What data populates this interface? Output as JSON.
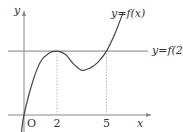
{
  "chart_data": {
    "type": "line",
    "title": "",
    "xlabel": "x",
    "ylabel": "y",
    "origin_label": "O",
    "x_ticks": [
      2,
      5
    ],
    "x_tick_labels": [
      "2",
      "5"
    ],
    "xlim": [
      -0.3,
      7.0
    ],
    "ylim": [
      -0.9,
      4.9
    ],
    "grid": false,
    "series": [
      {
        "name": "y=f(x)",
        "kind": "cubic",
        "description": "f(0)=0, local max at x=2, local min between 2 and 5, f(5)=f(2)",
        "points": [
          [
            -0.15,
            -0.8
          ],
          [
            0,
            0
          ],
          [
            0.5,
            1.5
          ],
          [
            1,
            2.5
          ],
          [
            1.5,
            2.9
          ],
          [
            2,
            3
          ],
          [
            2.5,
            2.85
          ],
          [
            3,
            2.4
          ],
          [
            3.5,
            2.1
          ],
          [
            4,
            2.2
          ],
          [
            4.5,
            2.5
          ],
          [
            5,
            3
          ],
          [
            5.5,
            3.8
          ],
          [
            6,
            4.8
          ]
        ]
      }
    ],
    "reference_lines": [
      {
        "name": "y=f(2)",
        "orientation": "horizontal",
        "value": 3
      }
    ],
    "guides": [
      {
        "x": 2,
        "from": 0,
        "to": 3,
        "style": "dotted"
      },
      {
        "x": 5,
        "from": 0,
        "to": 3,
        "style": "dotted"
      }
    ],
    "annotations": [
      {
        "text": "y=f(x)",
        "position": "near curve top-right"
      },
      {
        "text": "y=f(2)",
        "position": "right end of horizontal line"
      }
    ]
  }
}
